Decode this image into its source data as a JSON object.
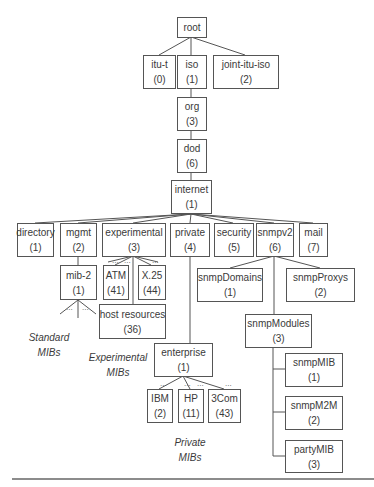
{
  "nodes": {
    "root": {
      "name": "root",
      "num": ""
    },
    "itu_t": {
      "name": "itu-t",
      "num": "(0)"
    },
    "iso": {
      "name": "iso",
      "num": "(1)"
    },
    "joint": {
      "name": "joint-itu-iso",
      "num": "(2)"
    },
    "org": {
      "name": "org",
      "num": "(3)"
    },
    "dod": {
      "name": "dod",
      "num": "(6)"
    },
    "internet": {
      "name": "internet",
      "num": "(1)"
    },
    "directory": {
      "name": "directory",
      "num": "(1)"
    },
    "mgmt": {
      "name": "mgmt",
      "num": "(2)"
    },
    "experimental": {
      "name": "experimental",
      "num": "(3)"
    },
    "private": {
      "name": "private",
      "num": "(4)"
    },
    "security": {
      "name": "security",
      "num": "(5)"
    },
    "snmpv2": {
      "name": "snmpv2",
      "num": "(6)"
    },
    "mail": {
      "name": "mail",
      "num": "(7)"
    },
    "mib2": {
      "name": "mib-2",
      "num": "(1)"
    },
    "atm": {
      "name": "ATM",
      "num": "(41)"
    },
    "x25": {
      "name": "X.25",
      "num": "(44)"
    },
    "host": {
      "name": "host resources",
      "num": "(36)"
    },
    "enterprise": {
      "name": "enterprise",
      "num": "(1)"
    },
    "ibm": {
      "name": "IBM",
      "num": "(2)"
    },
    "hp": {
      "name": "HP",
      "num": "(11)"
    },
    "threecom": {
      "name": "3Com",
      "num": "(43)"
    },
    "snmpDomains": {
      "name": "snmpDomains",
      "num": "(1)"
    },
    "snmpProxys": {
      "name": "snmpProxys",
      "num": "(2)"
    },
    "snmpModules": {
      "name": "snmpModules",
      "num": "(3)"
    },
    "snmpMIB": {
      "name": "snmpMIB",
      "num": "(1)"
    },
    "snmpM2M": {
      "name": "snmpM2M",
      "num": "(2)"
    },
    "partyMIB": {
      "name": "partyMIB",
      "num": "(3)"
    }
  },
  "labels": {
    "standard": {
      "line1": "Standard",
      "line2": "MIBs"
    },
    "experimental": {
      "line1": "Experimental",
      "line2": "MIBs"
    },
    "private": {
      "line1": "Private",
      "line2": "MIBs"
    }
  },
  "ellipsis": "..."
}
